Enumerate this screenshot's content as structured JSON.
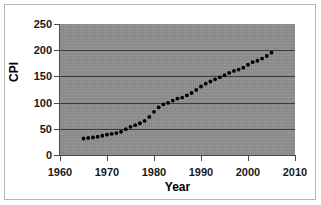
{
  "chart_data": {
    "type": "scatter",
    "title": "",
    "xlabel": "Year",
    "ylabel": "CPI",
    "xlim": [
      1960,
      2010
    ],
    "ylim": [
      0,
      250
    ],
    "xticks": [
      1960,
      1970,
      1980,
      1990,
      2000,
      2010
    ],
    "yticks": [
      0,
      50,
      100,
      150,
      200,
      250
    ],
    "xtick_labels": [
      "1960",
      "1970",
      "1980",
      "1990",
      "2000",
      "2010"
    ],
    "ytick_labels": [
      "0",
      "50",
      "100",
      "150",
      "200",
      "250"
    ],
    "grid": "horizontal",
    "legend": "none",
    "marker": "filled-circle",
    "marker_color": "#000000",
    "plot_background": "#8f8f8f",
    "figure_background": "#ffffff",
    "series": [
      {
        "name": "CPI",
        "x": [
          1965,
          1966,
          1967,
          1968,
          1969,
          1970,
          1971,
          1972,
          1973,
          1974,
          1975,
          1976,
          1977,
          1978,
          1979,
          1980,
          1981,
          1982,
          1983,
          1984,
          1985,
          1986,
          1987,
          1988,
          1989,
          1990,
          1991,
          1992,
          1993,
          1994,
          1995,
          1996,
          1997,
          1998,
          1999,
          2000,
          2001,
          2002,
          2003,
          2004,
          2005
        ],
        "y": [
          31.5,
          32.4,
          33.4,
          34.8,
          36.7,
          38.8,
          40.5,
          41.8,
          44.4,
          49.3,
          53.8,
          56.9,
          60.6,
          65.2,
          72.6,
          82.4,
          90.9,
          96.5,
          99.6,
          103.9,
          107.6,
          109.6,
          113.6,
          118.3,
          124.0,
          130.7,
          136.2,
          140.3,
          144.5,
          148.2,
          152.4,
          156.9,
          160.5,
          163.0,
          166.6,
          172.2,
          177.1,
          179.9,
          184.0,
          188.9,
          195.3
        ]
      }
    ]
  },
  "axes": {
    "ylabel_text": "CPI",
    "xlabel_text": "Year"
  }
}
